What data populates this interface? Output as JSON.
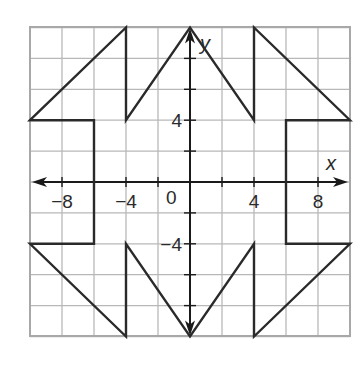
{
  "diagram": {
    "type": "coordinate-plane-figure",
    "x_axis_label": "x",
    "y_axis_label": "y",
    "x_range": [
      -10,
      10
    ],
    "y_range": [
      -10,
      10
    ],
    "grid_step": 2,
    "tick_step": 2,
    "origin_label": "0",
    "x_tick_labels": [
      {
        "value": -8,
        "text": "−8"
      },
      {
        "value": -4,
        "text": "−4"
      },
      {
        "value": 4,
        "text": "4"
      },
      {
        "value": 8,
        "text": "8"
      }
    ],
    "y_tick_labels": [
      {
        "value": 4,
        "text": "4"
      },
      {
        "value": -4,
        "text": "−4"
      }
    ],
    "figure_vertices": [
      [
        -10,
        4
      ],
      [
        -4,
        10
      ],
      [
        -4,
        4
      ],
      [
        0,
        10
      ],
      [
        4,
        4
      ],
      [
        4,
        10
      ],
      [
        10,
        4
      ],
      [
        6,
        4
      ],
      [
        6,
        -4
      ],
      [
        10,
        -4
      ],
      [
        4,
        -10
      ],
      [
        4,
        -4
      ],
      [
        0,
        -10
      ],
      [
        -4,
        -4
      ],
      [
        -4,
        -10
      ],
      [
        -10,
        -4
      ],
      [
        -6,
        -4
      ],
      [
        -6,
        4
      ]
    ],
    "colors": {
      "grid": "#b8b8b8",
      "axis": "#1a1a1a",
      "figure": "#2a2a2a",
      "background": "#ffffff"
    }
  }
}
